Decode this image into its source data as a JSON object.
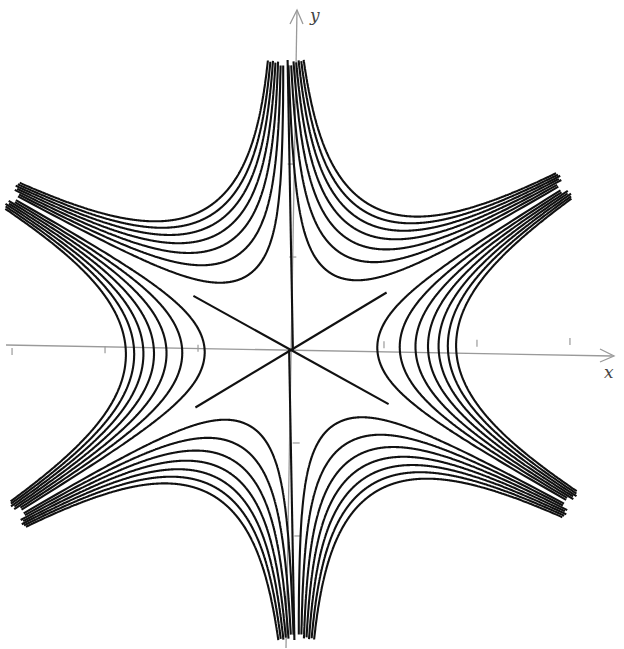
{
  "figure": {
    "axes": {
      "x_label": "x",
      "y_label": "y",
      "origin_px": [
        291,
        350
      ],
      "unit_px": 93,
      "x_ticks": [
        -3,
        -2,
        -1,
        1,
        2,
        3
      ],
      "y_ticks": [
        -2,
        -1,
        1,
        2
      ]
    },
    "colors": {
      "curve": "#111111",
      "axis": "#9a9a9a",
      "background": "#ffffff"
    }
  },
  "chart_data": {
    "type": "contour",
    "function": "x^3 - 3*x*y^2",
    "title": "",
    "xlabel": "x",
    "ylabel": "y",
    "levels": [
      -7,
      -6,
      -5,
      -4,
      -3,
      -2,
      -1,
      0,
      1,
      2,
      3,
      4,
      5,
      6,
      7
    ],
    "level_scale": 0.8,
    "zero_level_lines": [
      "x = 0",
      "y = x/sqrt(3)",
      "y = -x/sqrt(3)"
    ],
    "arm_directions_deg": [
      0,
      60,
      120,
      180,
      240,
      300
    ],
    "x_axis_crossings_right": [
      1.0,
      1.26,
      1.44,
      1.59,
      1.71,
      1.82,
      1.91
    ],
    "x_axis_crossings_left": [
      -1.0,
      -1.26,
      -1.44,
      -1.59,
      -1.71,
      -1.82,
      -1.91
    ],
    "xlim": [
      -3.1,
      3.4
    ],
    "ylim": [
      -3.2,
      3.7
    ],
    "grid": false,
    "legend": null
  }
}
